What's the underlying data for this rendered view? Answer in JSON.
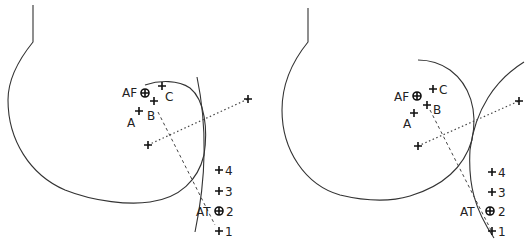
{
  "panels": [
    {
      "id": "left",
      "labels": {
        "AF": "AF",
        "C": "C",
        "B": "B",
        "A": "A",
        "AT": "AT",
        "p4": "4",
        "p3": "3",
        "p2": "2",
        "p1": "1"
      }
    },
    {
      "id": "right",
      "labels": {
        "AF": "AF",
        "C": "C",
        "B": "B",
        "A": "A",
        "AT": "AT",
        "p4": "4",
        "p3": "3",
        "p2": "2",
        "p1": "1"
      }
    }
  ]
}
